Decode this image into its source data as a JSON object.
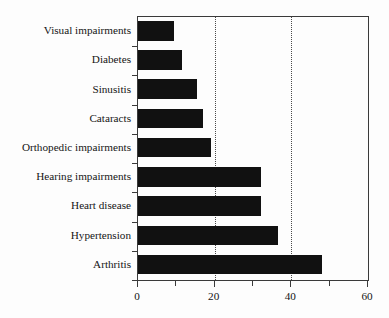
{
  "chart_data": {
    "type": "bar",
    "orientation": "horizontal",
    "title": "",
    "subtitle": "",
    "xlabel": "",
    "ylabel": "",
    "categories": [
      "Visual impairments",
      "Diabetes",
      "Sinusitis",
      "Cataracts",
      "Orthopedic impairments",
      "Hearing impairments",
      "Heart disease",
      "Hypertension",
      "Arthritis"
    ],
    "values": [
      9.5,
      11.5,
      15.5,
      17,
      19,
      32,
      32,
      36.5,
      48
    ],
    "xlim": [
      0,
      60
    ],
    "xticks": [
      0,
      20,
      40,
      60
    ],
    "xtick_labels": [
      "0",
      "20",
      "40",
      "60"
    ],
    "xticks_minor": [
      10,
      30,
      50
    ],
    "gridlines": [
      20,
      40
    ],
    "grid": true,
    "grid_style": "dotted",
    "legend": "none",
    "bar_color": "#111111",
    "axis_color": "#3a3a3a",
    "background_color": "#fdfdfd",
    "text_color": "#151515"
  }
}
